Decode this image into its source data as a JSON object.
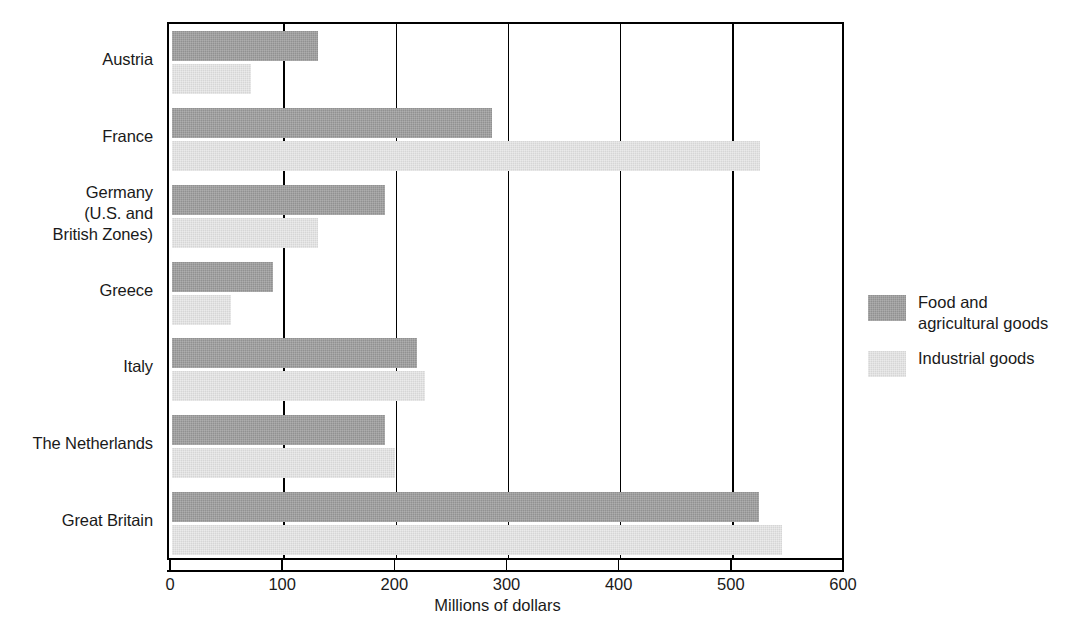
{
  "chart_data": {
    "type": "bar",
    "orientation": "horizontal",
    "title": "",
    "xlabel": "Millions of dollars",
    "ylabel": "",
    "xlim": [
      0,
      600
    ],
    "xticks": [
      0,
      100,
      200,
      300,
      400,
      500,
      600
    ],
    "xticklabels": [
      "0",
      "100",
      "200",
      "300",
      "400",
      "500",
      "600"
    ],
    "grid": "vertical",
    "legend_position": "right",
    "categories": [
      "Austria",
      "France",
      "Germany\n(U.S. and\nBritish Zones)",
      "Greece",
      "Italy",
      "The Netherlands",
      "Great Britain"
    ],
    "series": [
      {
        "name": "Food and agricultural goods",
        "color": "#919191",
        "values": [
          130,
          285,
          190,
          90,
          218,
          190,
          523
        ]
      },
      {
        "name": "Industrial goods",
        "color": "#d6d6d6",
        "values": [
          70,
          524,
          130,
          53,
          226,
          199,
          544
        ]
      }
    ]
  },
  "axis": {
    "x_title": "Millions of dollars",
    "ticks": [
      "0",
      "100",
      "200",
      "300",
      "400",
      "500",
      "600"
    ]
  },
  "categories": [
    {
      "id": "austria",
      "lines": [
        "Austria"
      ]
    },
    {
      "id": "france",
      "lines": [
        "France"
      ]
    },
    {
      "id": "germany",
      "lines": [
        "Germany",
        "(U.S. and",
        "British Zones)"
      ]
    },
    {
      "id": "greece",
      "lines": [
        "Greece"
      ]
    },
    {
      "id": "italy",
      "lines": [
        "Italy"
      ]
    },
    {
      "id": "netherlands",
      "lines": [
        "The Netherlands"
      ]
    },
    {
      "id": "great-britain",
      "lines": [
        "Great Britain"
      ]
    }
  ],
  "legend": {
    "items": [
      {
        "id": "food-agricultural",
        "label": "Food and\nagricultural goods",
        "color": "#919191"
      },
      {
        "id": "industrial",
        "label": "Industrial goods",
        "color": "#d6d6d6"
      }
    ]
  }
}
